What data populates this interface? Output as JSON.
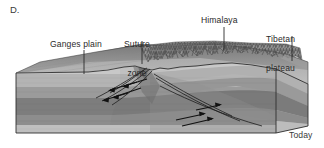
{
  "figure": {
    "panel_letter": "D.",
    "time_caption": "Today",
    "width": 324,
    "height": 148
  },
  "labels": [
    {
      "id": "ganges",
      "text": "Ganges plain",
      "leader_x": 84,
      "leader_y1": 50,
      "leader_y2": 74
    },
    {
      "id": "suture",
      "text": "Suture\nzone",
      "line1": "Suture",
      "line2": "zone",
      "leader_x": 142,
      "leader_y1": 41,
      "leader_y2": 63
    },
    {
      "id": "himalaya",
      "text": "Himalaya",
      "leader_x": 224,
      "leader_y1": 27,
      "leader_y2": 50
    },
    {
      "id": "tibetan",
      "text": "Tibetan\nplateau",
      "line1": "Tibetan",
      "line2": "plateau",
      "leader_x": 292,
      "leader_y1": 36,
      "leader_y2": 60
    }
  ],
  "diagram": {
    "type": "geologic-block-diagram",
    "features": [
      "Ganges plain",
      "Suture zone",
      "Himalaya",
      "Tibetan plateau",
      "thrust faults with sense-of-shear arrows"
    ],
    "strata": [
      {
        "name": "surface-sediment",
        "color": "#c9c9c9"
      },
      {
        "name": "upper-crust-light",
        "color": "#b5b5b5"
      },
      {
        "name": "mid-crust-medium",
        "color": "#9a9a9a"
      },
      {
        "name": "lower-crust-dark",
        "color": "#7e7e7e"
      },
      {
        "name": "mantle-lithosphere",
        "color": "#8d8d8d"
      },
      {
        "name": "basal-layer",
        "color": "#bdbdbd"
      }
    ],
    "colors": {
      "mountain_texture": "#6f6f6f",
      "highland_surface": "#8c8c8c",
      "plain_surface": "#a8a8a8",
      "outline": "#2f2f2f",
      "label_text": "#2b2b2b"
    }
  }
}
